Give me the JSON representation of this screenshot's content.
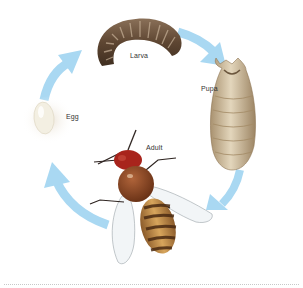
{
  "diagram": {
    "title": "",
    "stages": [
      {
        "id": "egg",
        "label": "Egg"
      },
      {
        "id": "larva",
        "label": "Larva"
      },
      {
        "id": "pupa",
        "label": "Pupa"
      },
      {
        "id": "adult",
        "label": "Adult"
      }
    ],
    "cycle_order": [
      "Egg",
      "Larva",
      "Pupa",
      "Adult"
    ],
    "arrow_color": "#a9d8f2",
    "colors": {
      "egg": "#f3efe2",
      "larva": "#6e5640",
      "pupa": "#c9b48f",
      "adult_body": "#7a3d1e",
      "adult_head": "#a8241c",
      "abdomen_stripe": "#c99449"
    }
  }
}
